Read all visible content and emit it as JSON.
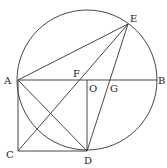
{
  "diagram": {
    "type": "geometry",
    "circle": {
      "center": "O",
      "cx": 87,
      "cy": 80,
      "r": 70
    },
    "points": {
      "A": {
        "x": 18,
        "y": 80,
        "label": "A",
        "lx": 4,
        "ly": 84
      },
      "B": {
        "x": 157,
        "y": 80,
        "label": "B",
        "lx": 158,
        "ly": 84
      },
      "O": {
        "x": 87,
        "y": 80,
        "label": "O",
        "lx": 89,
        "ly": 92
      },
      "F": {
        "x": 77,
        "y": 80,
        "label": "F",
        "lx": 73,
        "ly": 77
      },
      "G": {
        "x": 109,
        "y": 80,
        "label": "G",
        "lx": 110,
        "ly": 92
      },
      "E": {
        "x": 128,
        "y": 24,
        "label": "E",
        "lx": 130,
        "ly": 22
      },
      "C": {
        "x": 18,
        "y": 151,
        "label": "C",
        "lx": 6,
        "ly": 158
      },
      "D": {
        "x": 87,
        "y": 151,
        "label": "D",
        "lx": 84,
        "ly": 164
      }
    },
    "segments": [
      [
        "A",
        "B"
      ],
      [
        "A",
        "E"
      ],
      [
        "A",
        "C"
      ],
      [
        "C",
        "D"
      ],
      [
        "A",
        "D"
      ],
      [
        "C",
        "E"
      ],
      [
        "D",
        "E"
      ],
      [
        "O",
        "D"
      ]
    ],
    "stroke_color": "#333333"
  }
}
